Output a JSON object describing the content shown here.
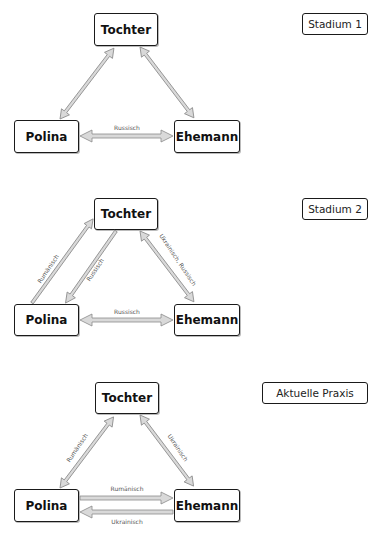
{
  "stages": [
    {
      "label": "Stadium 1",
      "nodes": {
        "tochter": "Tochter",
        "polina": "Polina",
        "ehemann": "Ehemann"
      },
      "edges": [
        {
          "from": "Polina",
          "to": "Tochter",
          "direction": "both",
          "label": ""
        },
        {
          "from": "Tochter",
          "to": "Ehemann",
          "direction": "both",
          "label": ""
        },
        {
          "from": "Polina",
          "to": "Ehemann",
          "direction": "both",
          "label": "Russisch"
        }
      ]
    },
    {
      "label": "Stadium 2",
      "nodes": {
        "tochter": "Tochter",
        "polina": "Polina",
        "ehemann": "Ehemann"
      },
      "edges": [
        {
          "from": "Polina",
          "to": "Tochter",
          "direction": "forward",
          "label": "Rumänisch"
        },
        {
          "from": "Tochter",
          "to": "Polina",
          "direction": "forward",
          "label": "Russisch"
        },
        {
          "from": "Tochter",
          "to": "Ehemann",
          "direction": "both",
          "label": "Ukrainisch, Russisch"
        },
        {
          "from": "Polina",
          "to": "Ehemann",
          "direction": "both",
          "label": "Russisch"
        }
      ]
    },
    {
      "label": "Aktuelle Praxis",
      "nodes": {
        "tochter": "Tochter",
        "polina": "Polina",
        "ehemann": "Ehemann"
      },
      "edges": [
        {
          "from": "Polina",
          "to": "Tochter",
          "direction": "both",
          "label": "Rumänisch"
        },
        {
          "from": "Tochter",
          "to": "Ehemann",
          "direction": "both",
          "label": "Ukrainisch"
        },
        {
          "from": "Polina",
          "to": "Ehemann",
          "direction": "forward",
          "label": "Rumänisch"
        },
        {
          "from": "Ehemann",
          "to": "Polina",
          "direction": "forward",
          "label": "Ukrainisch"
        }
      ]
    }
  ],
  "colors": {
    "arrow_fill": "#d9d9d9",
    "arrow_stroke": "#8a8a8a",
    "border": "#1a1a1a"
  }
}
